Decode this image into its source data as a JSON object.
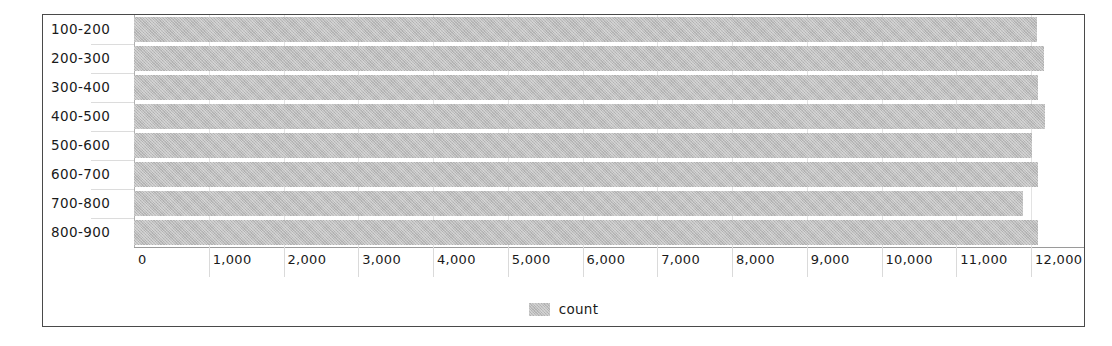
{
  "chart_data": {
    "type": "bar",
    "orientation": "horizontal",
    "title": "",
    "xlabel": "",
    "ylabel": "",
    "categories": [
      "100-200",
      "200-300",
      "300-400",
      "400-500",
      "500-600",
      "600-700",
      "700-800",
      "800-900"
    ],
    "series": [
      {
        "name": "count",
        "values": [
          12080,
          12170,
          12090,
          12190,
          12020,
          12090,
          11890,
          12090
        ]
      }
    ],
    "xlim": [
      0,
      12000
    ],
    "x_ticks": [
      0,
      1000,
      2000,
      3000,
      4000,
      5000,
      6000,
      7000,
      8000,
      9000,
      10000,
      11000,
      12000
    ],
    "x_tick_labels": [
      "0",
      "1,000",
      "2,000",
      "3,000",
      "4,000",
      "5,000",
      "6,000",
      "7,000",
      "8,000",
      "9,000",
      "10,000",
      "11,000",
      "12,000"
    ],
    "grid": true,
    "legend": {
      "position": "bottom",
      "entries": [
        {
          "label": "count",
          "color": "#bdbdbd"
        }
      ]
    },
    "colors": {
      "bar": "#bdbdbd",
      "grid": "#e3e3e3",
      "axis": "#9a9a9a",
      "frame": "#4a4a4a",
      "text": "#1a1a1a",
      "background": "#ffffff"
    }
  }
}
